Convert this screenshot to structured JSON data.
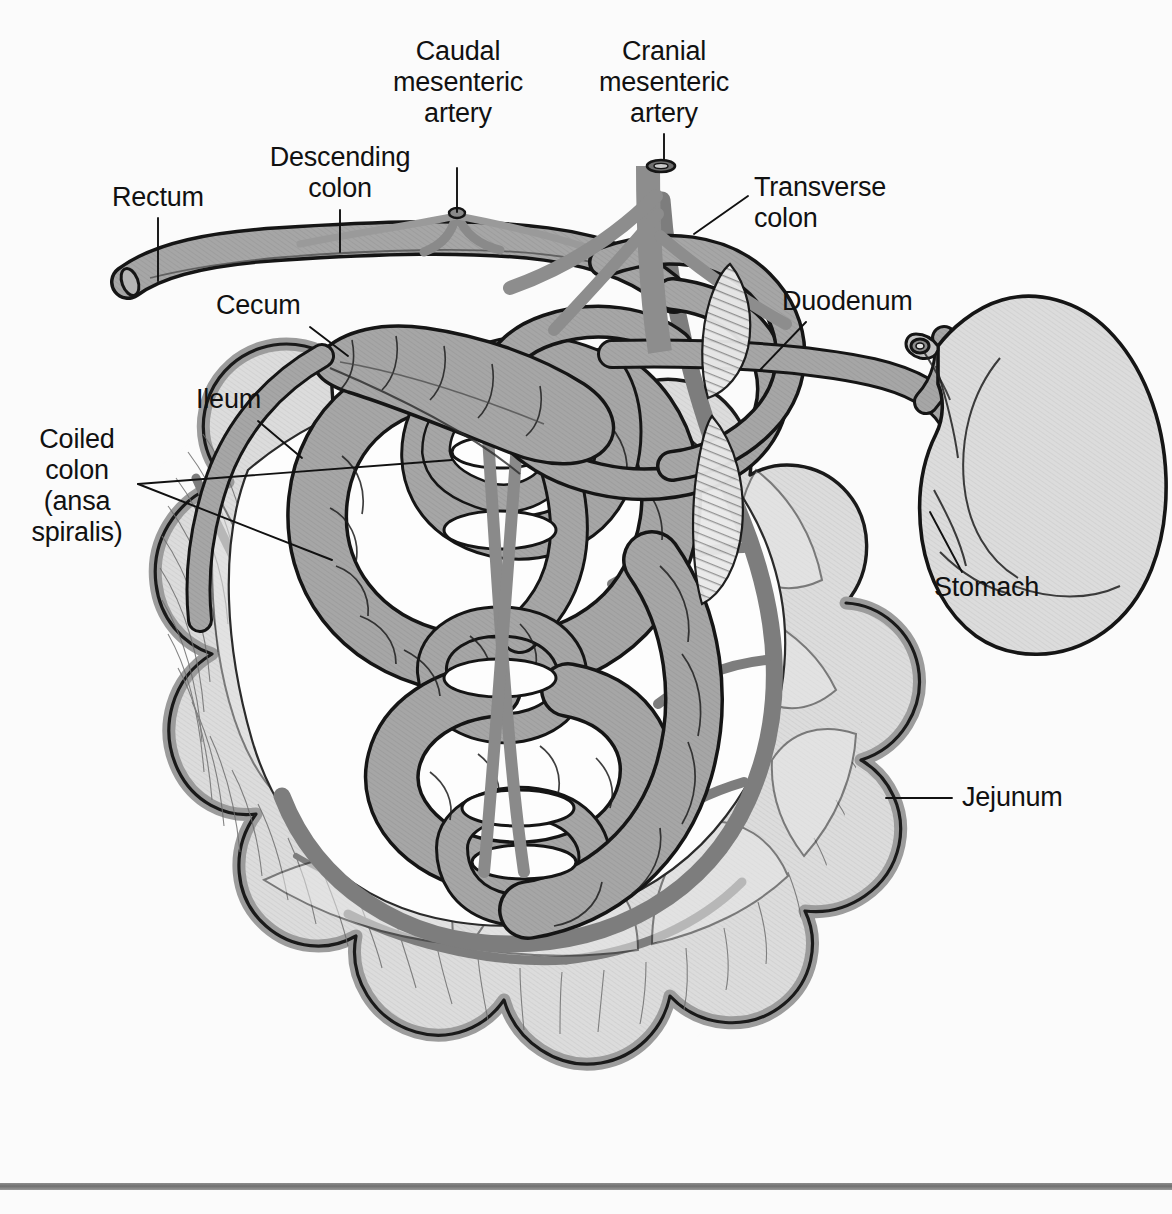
{
  "figure": {
    "background_color": "#fbfbfb",
    "ink_color": "#111111",
    "palette": {
      "organ_mid_gray": "#a6a6a6",
      "organ_light_gray": "#dadada",
      "vessel_gray": "#7d7d7d",
      "outline_black": "#151515",
      "hatch_gray": "#6f6f6f",
      "rule_gray": "#7d7d7d"
    }
  },
  "labels": [
    {
      "id": "rectum",
      "text": "Rectum",
      "align": "left",
      "x": 112,
      "y": 182,
      "leader": {
        "x1": 158,
        "y1": 218,
        "x2": 158,
        "y2": 281
      }
    },
    {
      "id": "descending-colon",
      "text": "Descending\ncolon",
      "align": "center",
      "x": 266,
      "y": 142,
      "leader": {
        "x1": 340,
        "y1": 210,
        "x2": 340,
        "y2": 252
      }
    },
    {
      "id": "caudal-mesenteric-artery",
      "text": "Caudal\nmesenteric\nartery",
      "align": "center",
      "x": 403,
      "y": 68,
      "leader": {
        "x1": 457,
        "y1": 168,
        "x2": 457,
        "y2": 214
      }
    },
    {
      "id": "cranial-mesenteric-artery",
      "text": "Cranial\nmesenteric\nartery",
      "align": "center",
      "x": 600,
      "y": 36,
      "leader": {
        "x1": 664,
        "y1": 134,
        "x2": 664,
        "y2": 163
      }
    },
    {
      "id": "transverse-colon",
      "text": "Transverse\ncolon",
      "align": "left",
      "x": 752,
      "y": 172,
      "leader": {
        "x1": 748,
        "y1": 196,
        "x2": 694,
        "y2": 232
      }
    },
    {
      "id": "duodenum",
      "text": "Duodenum",
      "align": "left",
      "x": 782,
      "y": 290,
      "leader": {
        "x1": 806,
        "y1": 322,
        "x2": 762,
        "y2": 368
      }
    },
    {
      "id": "cecum",
      "text": "Cecum",
      "align": "left",
      "x": 216,
      "y": 293,
      "leader": {
        "x1": 310,
        "y1": 327,
        "x2": 346,
        "y2": 355
      }
    },
    {
      "id": "ileum",
      "text": "Ileum",
      "align": "left",
      "x": 196,
      "y": 386,
      "leader": {
        "x1": 258,
        "y1": 421,
        "x2": 300,
        "y2": 456
      }
    },
    {
      "id": "coiled-colon",
      "text": "Coiled\ncolon\n(ansa\nspiralis)",
      "align": "center",
      "x": 44,
      "y": 426,
      "leaders": [
        {
          "x1": 138,
          "y1": 484,
          "x2": 450,
          "y2": 460
        },
        {
          "x1": 138,
          "y1": 484,
          "x2": 330,
          "y2": 558
        }
      ]
    },
    {
      "id": "stomach",
      "text": "Stomach",
      "align": "left",
      "x": 934,
      "y": 576,
      "leader": {
        "x1": 962,
        "y1": 572,
        "x2": 930,
        "y2": 512
      }
    },
    {
      "id": "jejunum",
      "text": "Jejunum",
      "align": "left",
      "x": 962,
      "y": 784,
      "leader": {
        "x1": 952,
        "y1": 798,
        "x2": 888,
        "y2": 798
      }
    }
  ],
  "bottom_rule": {
    "present": true
  }
}
